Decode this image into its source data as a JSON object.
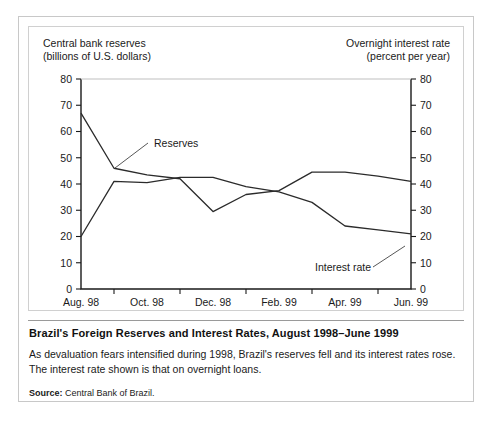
{
  "figure": {
    "caption_title": "Brazil's Foreign Reserves and Interest Rates, August 1998–June 1999",
    "caption_body": "As devaluation fears intensified during 1998, Brazil's reserves fell and its interest rates rose. The interest rate shown is that on overnight loans.",
    "source_label": "Source:",
    "source_text": "Central Bank of Brazil."
  },
  "chart_data": {
    "type": "line",
    "title": "",
    "xlabel": "",
    "ylabel": "Central bank reserves (billions of U.S. dollars)",
    "y2label": "Overnight interest rate (percent per year)",
    "left_axis_title_line1": "Central bank reserves",
    "left_axis_title_line2": "(billions of U.S. dollars)",
    "right_axis_title_line1": "Overnight interest rate",
    "right_axis_title_line2": "(percent per year)",
    "ylim": [
      0,
      80
    ],
    "y2lim": [
      0,
      80
    ],
    "yticks": [
      0,
      10,
      20,
      30,
      40,
      50,
      60,
      70,
      80
    ],
    "y2ticks": [
      0,
      10,
      20,
      30,
      40,
      50,
      60,
      70,
      80
    ],
    "grid": false,
    "legend_position": "inline-annotation",
    "x": [
      "Aug. 98",
      "Sep. 98",
      "Oct. 98",
      "Nov. 98",
      "Dec. 98",
      "Jan. 99",
      "Feb. 99",
      "Mar. 99",
      "Apr. 99",
      "May 99",
      "Jun. 99"
    ],
    "xtick_labels": [
      "Aug. 98",
      "Oct. 98",
      "Dec. 98",
      "Feb. 99",
      "Apr. 99",
      "Jun. 99"
    ],
    "xtick_indices": [
      0,
      2,
      4,
      6,
      8,
      10
    ],
    "series": [
      {
        "name": "Reserves",
        "axis": "left",
        "values": [
          67,
          46,
          43.5,
          42,
          29.5,
          36,
          37.5,
          44.5,
          44.5,
          43,
          41
        ]
      },
      {
        "name": "Interest rate",
        "axis": "right",
        "values": [
          20,
          41,
          40.5,
          42.5,
          42.5,
          39,
          37,
          33,
          24,
          22.5,
          21
        ]
      }
    ],
    "annotations": [
      {
        "text": "Reserves",
        "label_x": 125,
        "label_y": 120,
        "leader_from_x": 119,
        "leader_from_y": 116,
        "leader_to_x": 86,
        "leader_to_y": 141
      },
      {
        "text": "Interest rate",
        "label_x": 286,
        "label_y": 244,
        "leader_from_x": 344,
        "leader_from_y": 240,
        "leader_to_x": 376,
        "leader_to_y": 219
      }
    ]
  }
}
